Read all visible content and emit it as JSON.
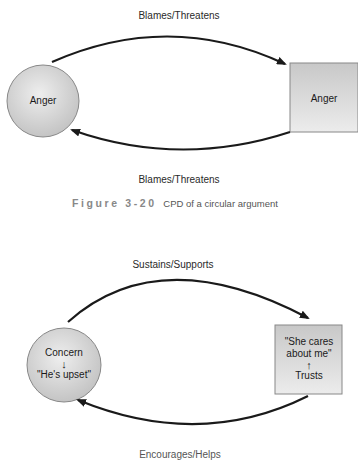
{
  "figure1": {
    "top_label": "Blames/Threatens",
    "bottom_label": "Blames/Threatens",
    "circle_label": "Anger",
    "square_label": "Anger"
  },
  "caption": {
    "figure_number": "Figure 3-20",
    "text": "CPD of a circular argument"
  },
  "figure2": {
    "top_label": "Sustains/Supports",
    "circle_line1": "Concern",
    "circle_arrow": "↓",
    "circle_line2": "\"He's upset\"",
    "square_line1": "\"She cares",
    "square_line2": "about me\"",
    "square_arrow": "↑",
    "square_line3": "Trusts",
    "bottom_label_cut": "Encourages/Helps"
  },
  "colors": {
    "node_fill_light": "#e6e6e6",
    "node_fill_dark": "#bdbdbd",
    "stroke": "#1a1a1a"
  }
}
